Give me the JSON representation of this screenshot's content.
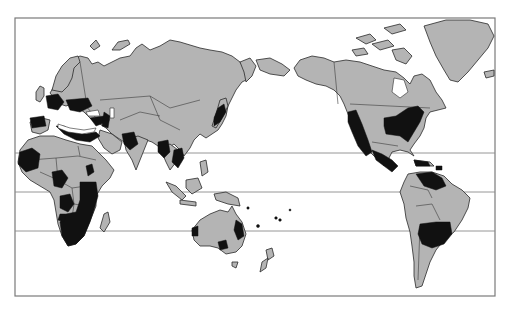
{
  "map": {
    "projection": "Pacific-centered world map",
    "colors": {
      "background": "#ffffff",
      "land": "#b4b4b4",
      "highlighted_region": "#111111",
      "frame": "#7a7a7a",
      "reference_lines": "#8a8a8a"
    },
    "frame": {
      "x": 15,
      "y": 18,
      "width": 480,
      "height": 278
    },
    "reference_lines_y": [
      153,
      192,
      231
    ],
    "continents": [
      "Europe",
      "Asia",
      "Africa",
      "Australia",
      "North America",
      "South America",
      "Greenland",
      "New Zealand"
    ],
    "highlighted_regions": [
      "Western Europe",
      "Southern Europe / Mediterranean",
      "Middle East",
      "India",
      "Southeast Asia",
      "Japan",
      "West Africa",
      "Central Africa",
      "East Africa",
      "Southern Africa",
      "Western Australia",
      "Eastern Australia",
      "Western United States",
      "Eastern United States",
      "Mexico / Central America",
      "Caribbean",
      "Northern South America",
      "South-central South America"
    ]
  }
}
